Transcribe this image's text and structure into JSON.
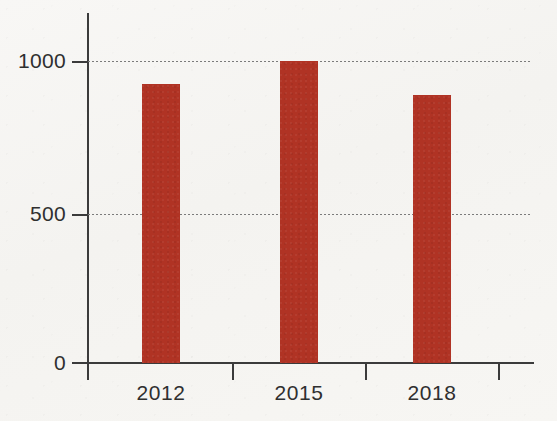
{
  "chart_data": {
    "type": "bar",
    "title": "",
    "subtitle": "",
    "xlabel": "",
    "ylabel": "",
    "categories": [
      "2012",
      "2015",
      "2018"
    ],
    "values": [
      924,
      1000,
      887
    ],
    "series": [
      {
        "name": "",
        "values": [
          924,
          1000,
          887
        ]
      }
    ],
    "ylim": [
      0,
      1160
    ],
    "xlim": [
      0,
      4
    ],
    "y_ticks": [
      0,
      500,
      1000
    ],
    "y_tick_labels": [
      "0",
      "500",
      "1000"
    ],
    "x_tick_labels": [
      "2012",
      "2015",
      "2018"
    ],
    "gridlines": {
      "horizontal": [
        500,
        1000
      ],
      "vertical": [],
      "style": "dotted",
      "color": "#7b7b7b"
    },
    "legend": {
      "visible": false,
      "position": "none",
      "entries": []
    },
    "annotations": [],
    "colors": {
      "bar": "#b03324",
      "axis": "#3b3b3b",
      "grid": "#7b7b7b",
      "text": "#2f2f2f",
      "background": "#f6f5f3"
    }
  },
  "axes": {
    "y_labels": [
      {
        "text": "1000",
        "value": 1000
      },
      {
        "text": "500",
        "value": 500
      },
      {
        "text": "0",
        "value": 0
      }
    ],
    "x_labels": [
      {
        "text": "2012"
      },
      {
        "text": "2015"
      },
      {
        "text": "2018"
      }
    ]
  }
}
